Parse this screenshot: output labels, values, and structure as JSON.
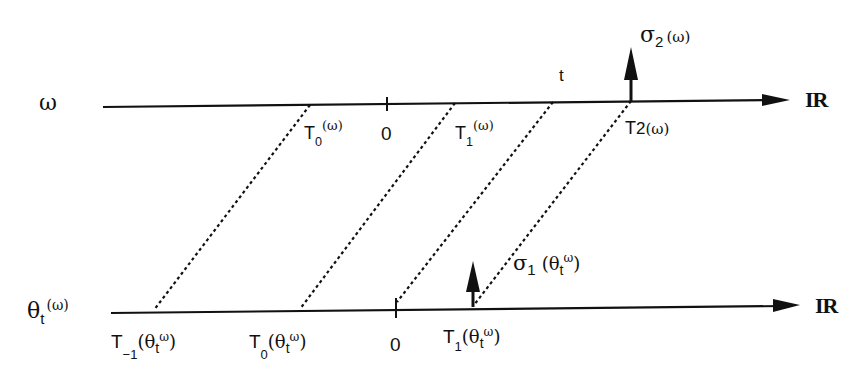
{
  "diagram": {
    "type": "time-shift diagram",
    "top_axis": {
      "left_label": "ω",
      "right_label": "IR",
      "points": [
        {
          "id": "T0",
          "label_main": "T",
          "label_sub": "0",
          "label_arg": "(ω)"
        },
        {
          "id": "zero",
          "label": "0"
        },
        {
          "id": "T1",
          "label_main": "T",
          "label_sub": "1",
          "label_arg": "(ω)"
        },
        {
          "id": "t",
          "label": "t"
        },
        {
          "id": "T2",
          "label_main": "T",
          "label_sub": "2",
          "label_arg": "(ω)"
        }
      ],
      "arrow_label": {
        "main": "σ",
        "sub": "2",
        "arg": "(ω)"
      }
    },
    "bottom_axis": {
      "left_label_main": "θ",
      "left_label_sub": "t",
      "left_label_arg": "(ω)",
      "right_label": "IR",
      "points": [
        {
          "id": "T-1",
          "label_main": "T",
          "label_sub": "−1",
          "label_arg_open": "(θ",
          "label_arg_sub": "t",
          "label_arg_sup": "ω",
          "label_arg_close": ")"
        },
        {
          "id": "T0",
          "label_main": "T",
          "label_sub": "0",
          "label_arg_open": "(θ",
          "label_arg_sub": "t",
          "label_arg_sup": "ω",
          "label_arg_close": ")"
        },
        {
          "id": "zero",
          "label": "0"
        },
        {
          "id": "T1",
          "label_main": "T",
          "label_sub": "1",
          "label_arg_open": "(θ",
          "label_arg_sub": "t",
          "label_arg_sup": "ω",
          "label_arg_close": ")"
        }
      ],
      "arrow_label": {
        "main": "σ",
        "sub": "1",
        "arg_open": "(θ",
        "arg_sub": "t",
        "arg_sup": "ω",
        "arg_close": ")"
      }
    }
  }
}
